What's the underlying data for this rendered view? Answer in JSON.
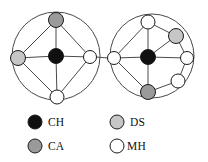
{
  "figure": {
    "title": "",
    "background_color": "#ffffff",
    "edge_color": "#4a4a4a",
    "node_stroke_color": "#1a1a1a"
  },
  "colors": {
    "CH": "#101010",
    "CA": "#9a9a9a",
    "DS": "#c6c6c6",
    "MH": "#ffffff"
  },
  "clusters": [
    {
      "id": "left-cluster",
      "name": "left-cluster",
      "outline": {
        "cx": 56,
        "cy": 56,
        "r": 44
      },
      "nodes": [
        {
          "id": "L-center",
          "type": "CH",
          "cx": 56,
          "cy": 56,
          "r": 7.5
        },
        {
          "id": "L-top",
          "type": "CA",
          "cx": 56,
          "cy": 20,
          "r": 7.5
        },
        {
          "id": "L-left",
          "type": "DS",
          "cx": 18,
          "cy": 58,
          "r": 7.5
        },
        {
          "id": "L-right",
          "type": "MH",
          "cx": 90,
          "cy": 57,
          "r": 6.5
        },
        {
          "id": "L-bottom",
          "type": "MH",
          "cx": 57,
          "cy": 97,
          "r": 7.0
        }
      ],
      "edges": [
        [
          "L-center",
          "L-top"
        ],
        [
          "L-center",
          "L-left"
        ],
        [
          "L-center",
          "L-right"
        ],
        [
          "L-center",
          "L-bottom"
        ],
        [
          "L-top",
          "L-left"
        ],
        [
          "L-top",
          "L-right"
        ],
        [
          "L-left",
          "L-bottom"
        ],
        [
          "L-right",
          "L-bottom"
        ]
      ]
    },
    {
      "id": "right-cluster",
      "name": "right-cluster",
      "outline": {
        "cx": 152,
        "cy": 56,
        "r": 42
      },
      "nodes": [
        {
          "id": "R-center",
          "type": "CH",
          "cx": 148,
          "cy": 57,
          "r": 7.5
        },
        {
          "id": "R-top",
          "type": "MH",
          "cx": 148,
          "cy": 22,
          "r": 7.0
        },
        {
          "id": "R-upperright",
          "type": "DS",
          "cx": 176,
          "cy": 36,
          "r": 7.5
        },
        {
          "id": "R-left",
          "type": "MH",
          "cx": 114,
          "cy": 58,
          "r": 6.5
        },
        {
          "id": "R-right",
          "type": "MH",
          "cx": 187,
          "cy": 58,
          "r": 6.5
        },
        {
          "id": "R-lowerright",
          "type": "MH",
          "cx": 178,
          "cy": 81,
          "r": 7.0
        },
        {
          "id": "R-bottom",
          "type": "CA",
          "cx": 148,
          "cy": 92,
          "r": 7.5
        }
      ],
      "edges": [
        [
          "R-center",
          "R-top"
        ],
        [
          "R-center",
          "R-upperright"
        ],
        [
          "R-center",
          "R-left"
        ],
        [
          "R-center",
          "R-right"
        ],
        [
          "R-center",
          "R-bottom"
        ],
        [
          "R-top",
          "R-left"
        ],
        [
          "R-top",
          "R-upperright"
        ],
        [
          "R-left",
          "R-bottom"
        ],
        [
          "R-bottom",
          "R-lowerright"
        ],
        [
          "R-lowerright",
          "R-right"
        ],
        [
          "R-right",
          "R-upperright"
        ]
      ]
    }
  ],
  "inter_cluster_edges": [
    {
      "from": "L-right",
      "to": "R-left",
      "x1": 96,
      "y1": 57,
      "x2": 108,
      "y2": 58
    }
  ],
  "legend": {
    "name": "node-type-legend",
    "columns": [
      {
        "items": [
          {
            "key": "CH",
            "label": "CH",
            "swatch_color": "#101010",
            "cx": 35,
            "cy": 122,
            "r": 7.0,
            "text_x": 48,
            "text_y": 126
          },
          {
            "key": "CA",
            "label": "CA",
            "swatch_color": "#9a9a9a",
            "cx": 35,
            "cy": 146,
            "r": 7.0,
            "text_x": 48,
            "text_y": 150
          }
        ]
      },
      {
        "items": [
          {
            "key": "DS",
            "label": "DS",
            "swatch_color": "#c6c6c6",
            "cx": 117,
            "cy": 122,
            "r": 7.0,
            "text_x": 130,
            "text_y": 126
          },
          {
            "key": "MH",
            "label": "MH",
            "swatch_color": "#ffffff",
            "cx": 117,
            "cy": 146,
            "r": 7.0,
            "text_x": 127,
            "text_y": 150
          }
        ]
      }
    ]
  },
  "chart_data": {
    "type": "diagram",
    "title": "",
    "node_types": [
      {
        "code": "CH",
        "color": "#101010",
        "count": 2
      },
      {
        "code": "CA",
        "color": "#9a9a9a",
        "count": 2
      },
      {
        "code": "DS",
        "color": "#c6c6c6",
        "count": 2
      },
      {
        "code": "MH",
        "color": "#ffffff",
        "count": 6
      }
    ],
    "total_nodes": 12,
    "cluster_count": 2,
    "left_cluster_nodes": 5,
    "right_cluster_nodes": 7,
    "bridge_edges": 1
  }
}
